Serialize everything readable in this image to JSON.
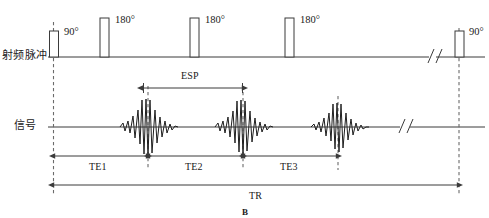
{
  "figure": {
    "caption": "B",
    "width": 489,
    "height": 218,
    "line_color": "#3b3b3b",
    "dash_color": "#6b6b6b",
    "text_color": "#1a1a1a",
    "background": "#ffffff"
  },
  "rows": [
    {
      "id": "rf",
      "label": "射频脉冲",
      "baseline_y": 57
    },
    {
      "id": "signal",
      "label": "信号",
      "baseline_y": 127
    }
  ],
  "rf_pulses": [
    {
      "name": "excitation-90-first",
      "angle_label": "90°",
      "x": 53,
      "width": 9,
      "height": 26,
      "dashed_marker": true
    },
    {
      "name": "refocus-180-1",
      "angle_label": "180°",
      "x": 100,
      "width": 9,
      "height": 39,
      "dashed_marker": false
    },
    {
      "name": "refocus-180-2",
      "angle_label": "180°",
      "x": 190,
      "width": 9,
      "height": 39,
      "dashed_marker": false
    },
    {
      "name": "refocus-180-3",
      "angle_label": "180°",
      "x": 285,
      "width": 9,
      "height": 39,
      "dashed_marker": false
    },
    {
      "name": "excitation-90-next",
      "angle_label": "90°",
      "x": 455,
      "width": 9,
      "height": 26,
      "dashed_marker": true
    }
  ],
  "echoes": [
    {
      "name": "echo-1",
      "center_x": 148,
      "amplitude": 27
    },
    {
      "name": "echo-2",
      "center_x": 243,
      "amplitude": 26
    },
    {
      "name": "echo-3",
      "center_x": 338,
      "amplitude": 24
    }
  ],
  "time_markers": [
    {
      "name": "marker-tr-start",
      "x": 53
    },
    {
      "name": "marker-echo-1",
      "x": 148
    },
    {
      "name": "marker-echo-2",
      "x": 243
    },
    {
      "name": "marker-echo-3",
      "x": 338
    },
    {
      "name": "marker-tr-end",
      "x": 459
    }
  ],
  "break_marks": [
    {
      "name": "break-mark-rf",
      "x": 432,
      "y": 57
    },
    {
      "name": "break-mark-signal",
      "x": 404,
      "y": 127
    }
  ],
  "intervals": [
    {
      "name": "esp-span",
      "label": "ESP",
      "x1": 143,
      "x2": 242,
      "y": 88,
      "label_y": 75,
      "label_x": 192
    },
    {
      "name": "te1-span",
      "label": "TE1",
      "x1": 54,
      "x2": 147,
      "y": 156,
      "label_y": 166,
      "label_x": 100
    },
    {
      "name": "te2-span",
      "label": "TE2",
      "x1": 149,
      "x2": 242,
      "y": 156,
      "label_y": 166,
      "label_x": 196
    },
    {
      "name": "te3-span",
      "label": "TE3",
      "x1": 244,
      "x2": 337,
      "y": 156,
      "label_y": 166,
      "label_x": 291
    },
    {
      "name": "tr-span",
      "label": "TR",
      "x1": 53,
      "x2": 458,
      "y": 185,
      "label_y": 195,
      "label_x": 256
    }
  ]
}
